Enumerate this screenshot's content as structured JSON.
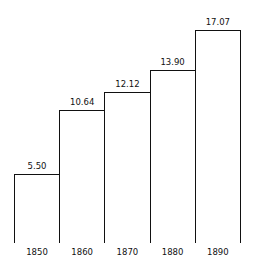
{
  "chart_data": {
    "type": "bar",
    "title": "",
    "xlabel": "",
    "ylabel": "",
    "categories": [
      "1850",
      "1860",
      "1870",
      "1880",
      "1890"
    ],
    "values": [
      5.5,
      10.64,
      12.12,
      13.9,
      17.07
    ],
    "value_labels": [
      "5.50",
      "10.64",
      "12.12",
      "13.90",
      "17.07"
    ],
    "ylim": [
      0,
      17.07
    ],
    "grid": false,
    "legend": null,
    "bar_style": "adjacent outlined bars, white fill, black stroke"
  }
}
